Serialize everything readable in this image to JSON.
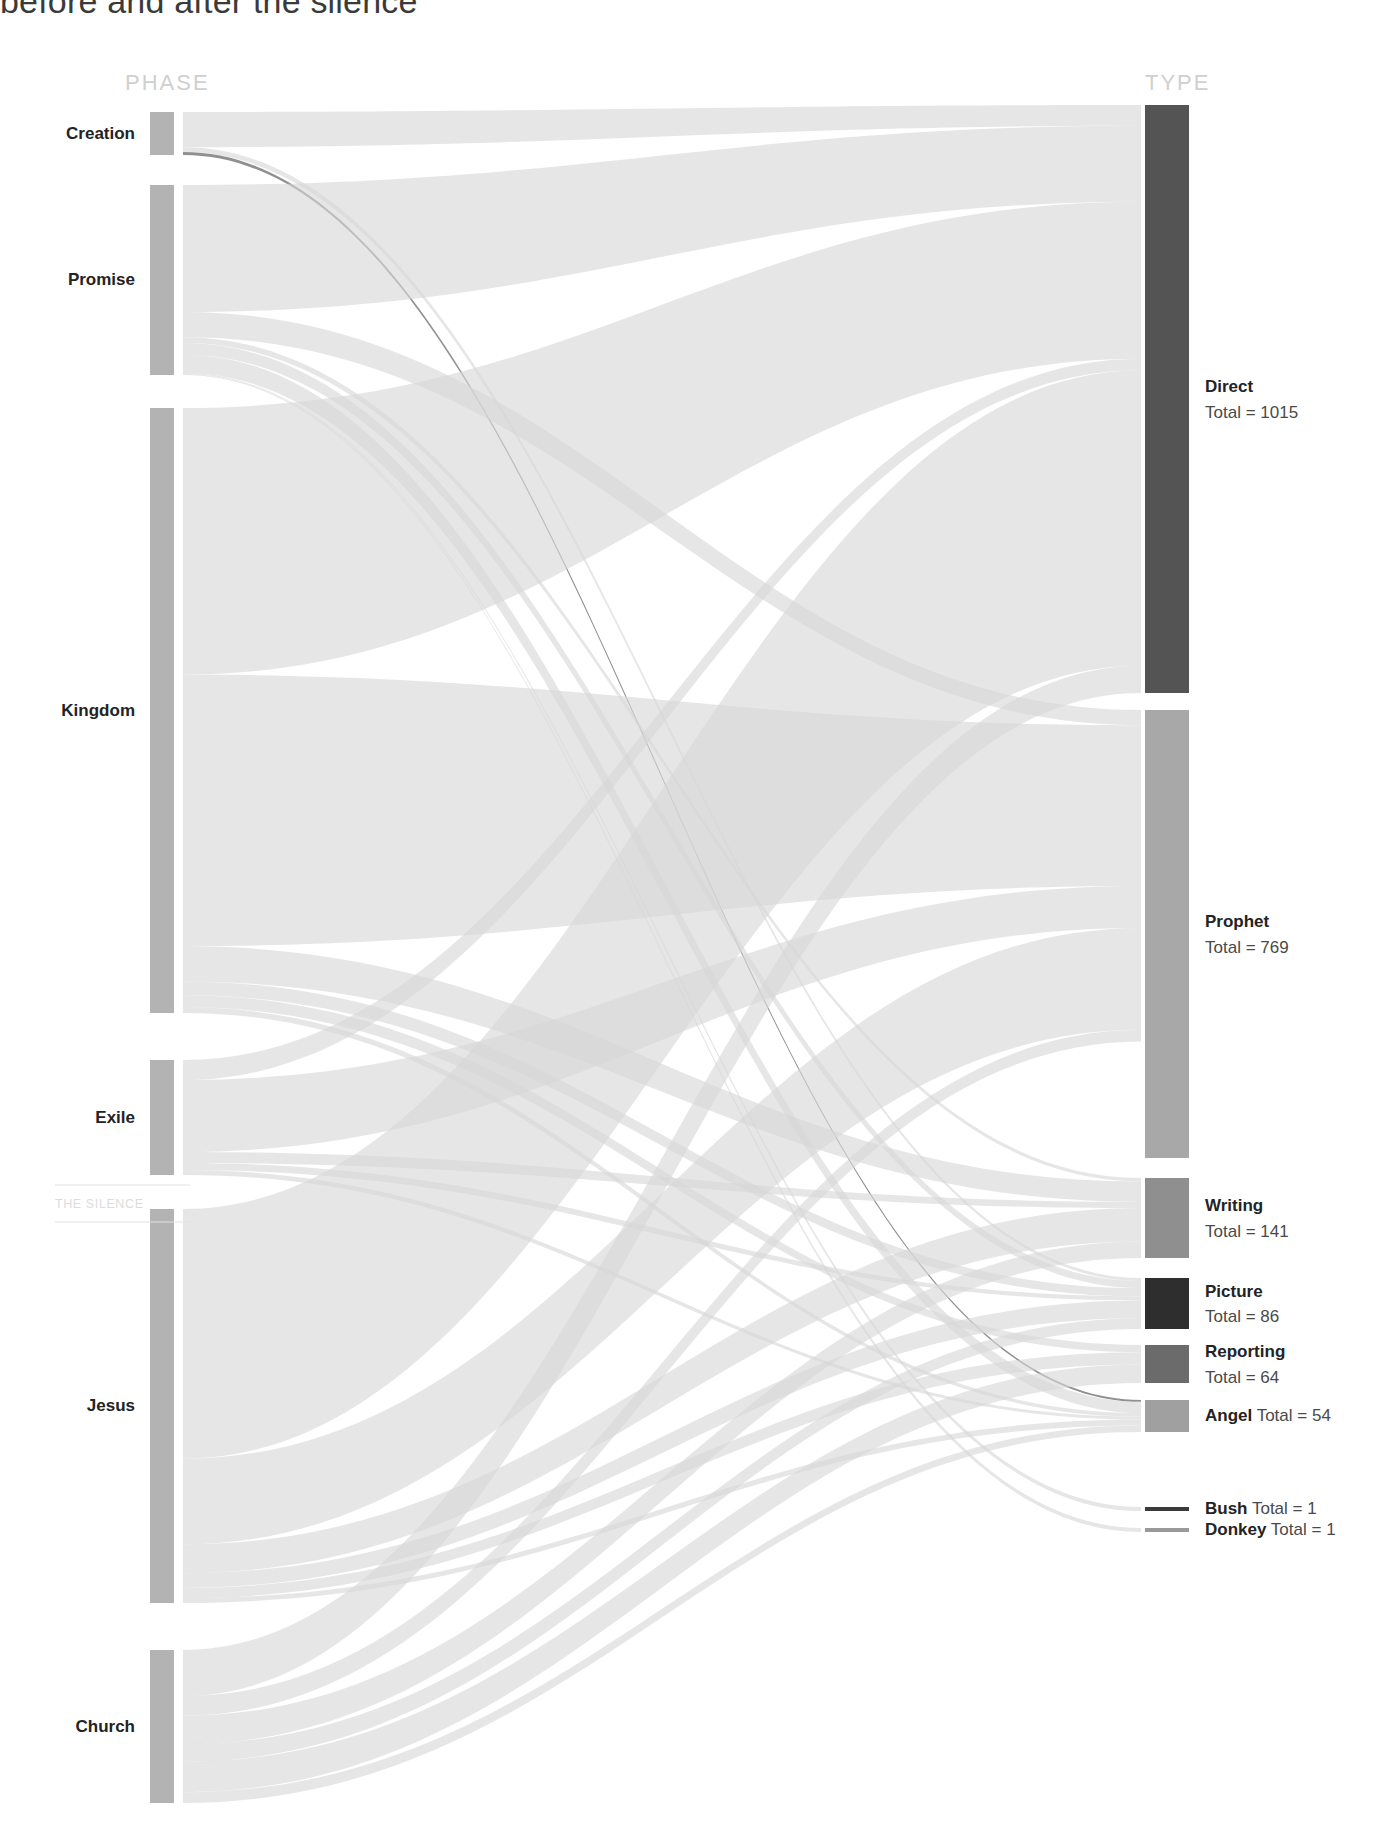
{
  "title": "before and after the silence",
  "columns": {
    "left_header": "PHASE",
    "right_header": "TYPE"
  },
  "divider": {
    "label": "THE SILENCE"
  },
  "colors": {
    "node_phase": "#b3b3b3",
    "node_direct": "#545454",
    "node_prophet": "#a8a8a8",
    "node_writing": "#8f8f8f",
    "node_picture": "#2e2e2e",
    "node_reporting": "#6b6b6b",
    "node_angel": "#a0a0a0",
    "node_bush": "#3a3a3a",
    "node_donkey": "#9a9a9a",
    "link_default": "#d6d6d6",
    "header_text": "#cfcfcf",
    "label_text": "#232323",
    "silence_text": "#dcdcdc"
  },
  "chart_data": {
    "type": "sankey",
    "title": "before and after the silence",
    "xlabel": "",
    "ylabel": "",
    "legend": "right",
    "grid": false,
    "nodes": {
      "phase": [
        {
          "id": "creation",
          "label": "Creation",
          "total": 44
        },
        {
          "id": "promise",
          "label": "Promise",
          "total": 196
        },
        {
          "id": "kingdom",
          "label": "Kingdom",
          "total": 615
        },
        {
          "id": "exile",
          "label": "Exile",
          "total": 115
        },
        {
          "id": "jesus",
          "label": "Jesus",
          "total": 805
        },
        {
          "id": "church",
          "label": "Church",
          "total": 156
        }
      ],
      "type": [
        {
          "id": "direct",
          "label": "Direct",
          "total": 1015,
          "total_text": "Total = 1015"
        },
        {
          "id": "prophet",
          "label": "Prophet",
          "total": 769,
          "total_text": "Total = 769"
        },
        {
          "id": "writing",
          "label": "Writing",
          "total": 141,
          "total_text": "Total = 141"
        },
        {
          "id": "picture",
          "label": "Picture",
          "total": 86,
          "total_text": "Total = 86"
        },
        {
          "id": "reporting",
          "label": "Reporting",
          "total": 64,
          "total_text": "Total = 64"
        },
        {
          "id": "angel",
          "label": "Angel",
          "total": 54,
          "total_text": "Total = 54"
        },
        {
          "id": "bush",
          "label": "Bush",
          "total": 1,
          "total_text": "Total = 1"
        },
        {
          "id": "donkey",
          "label": "Donkey",
          "total": 1,
          "total_text": "Total = 1"
        }
      ]
    },
    "links": [
      {
        "source": "creation",
        "target": "direct",
        "value": 36
      },
      {
        "source": "creation",
        "target": "picture",
        "value": 5
      },
      {
        "source": "creation",
        "target": "angel",
        "value": 3
      },
      {
        "source": "promise",
        "target": "direct",
        "value": 131
      },
      {
        "source": "promise",
        "target": "prophet",
        "value": 26
      },
      {
        "source": "promise",
        "target": "angel",
        "value": 19
      },
      {
        "source": "promise",
        "target": "picture",
        "value": 12
      },
      {
        "source": "promise",
        "target": "writing",
        "value": 6
      },
      {
        "source": "promise",
        "target": "bush",
        "value": 1
      },
      {
        "source": "promise",
        "target": "donkey",
        "value": 1
      },
      {
        "source": "kingdom",
        "target": "direct",
        "value": 271
      },
      {
        "source": "kingdom",
        "target": "prophet",
        "value": 276
      },
      {
        "source": "kingdom",
        "target": "writing",
        "value": 36
      },
      {
        "source": "kingdom",
        "target": "picture",
        "value": 14
      },
      {
        "source": "kingdom",
        "target": "reporting",
        "value": 12
      },
      {
        "source": "kingdom",
        "target": "angel",
        "value": 6
      },
      {
        "source": "exile",
        "target": "prophet",
        "value": 72
      },
      {
        "source": "exile",
        "target": "direct",
        "value": 20
      },
      {
        "source": "exile",
        "target": "writing",
        "value": 11
      },
      {
        "source": "exile",
        "target": "picture",
        "value": 7
      },
      {
        "source": "exile",
        "target": "angel",
        "value": 5
      },
      {
        "source": "jesus",
        "target": "direct",
        "value": 510
      },
      {
        "source": "jesus",
        "target": "prophet",
        "value": 175
      },
      {
        "source": "jesus",
        "target": "writing",
        "value": 59
      },
      {
        "source": "jesus",
        "target": "picture",
        "value": 30
      },
      {
        "source": "jesus",
        "target": "reporting",
        "value": 21
      },
      {
        "source": "jesus",
        "target": "angel",
        "value": 10
      },
      {
        "source": "church",
        "target": "direct",
        "value": 47
      },
      {
        "source": "church",
        "target": "prophet",
        "value": 20
      },
      {
        "source": "church",
        "target": "writing",
        "value": 29
      },
      {
        "source": "church",
        "target": "reporting",
        "value": 31
      },
      {
        "source": "church",
        "target": "picture",
        "value": 18
      },
      {
        "source": "church",
        "target": "angel",
        "value": 11
      }
    ]
  }
}
